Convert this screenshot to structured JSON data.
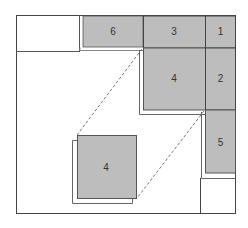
{
  "diagram": {
    "title": "",
    "colors": {
      "block_fill": "#bdbdbd",
      "border": "#444444",
      "outline": "#666666",
      "background": "#ffffff"
    },
    "blocks": [
      {
        "id": "block-6",
        "label": "6"
      },
      {
        "id": "block-3",
        "label": "3"
      },
      {
        "id": "block-1",
        "label": "1"
      },
      {
        "id": "block-4-top",
        "label": "4"
      },
      {
        "id": "block-2",
        "label": "2"
      },
      {
        "id": "block-5",
        "label": "5"
      },
      {
        "id": "block-4-moved",
        "label": "4"
      }
    ]
  }
}
